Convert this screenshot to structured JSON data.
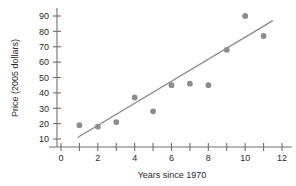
{
  "chart_data": {
    "type": "scatter",
    "title": "",
    "xlabel": "Years since 1970",
    "ylabel": "Price (2005 dollars)",
    "xlim": [
      0,
      12
    ],
    "ylim": [
      10,
      90
    ],
    "grid": false,
    "legend": "none",
    "x_major_ticks": [
      0,
      2,
      4,
      6,
      8,
      10,
      12
    ],
    "x_minor_ticks": [
      1,
      3,
      5,
      7,
      9,
      11
    ],
    "x_tick_labels": [
      "0",
      "2",
      "4",
      "6",
      "8",
      "10",
      "12"
    ],
    "y_ticks": [
      10,
      20,
      30,
      40,
      50,
      60,
      70,
      80,
      90
    ],
    "y_tick_labels": [
      "10",
      "20",
      "30",
      "40",
      "50",
      "60",
      "70",
      "80",
      "90"
    ],
    "points": [
      {
        "x": 1,
        "y": 19
      },
      {
        "x": 2,
        "y": 18
      },
      {
        "x": 3,
        "y": 21
      },
      {
        "x": 4,
        "y": 37
      },
      {
        "x": 5,
        "y": 28
      },
      {
        "x": 6,
        "y": 45
      },
      {
        "x": 7,
        "y": 46
      },
      {
        "x": 8,
        "y": 45
      },
      {
        "x": 9,
        "y": 68
      },
      {
        "x": 10,
        "y": 90
      },
      {
        "x": 11,
        "y": 77
      }
    ],
    "trend_line": {
      "x_start": 0.9,
      "y_start": 11,
      "x_end": 11.5,
      "y_end": 87
    },
    "marker_color": "#8d8d8d",
    "trend_color": "#8a8a8a",
    "axis_color": "#6f6f6f",
    "text_color": "#2b2b2b",
    "background": "#ffffff"
  }
}
